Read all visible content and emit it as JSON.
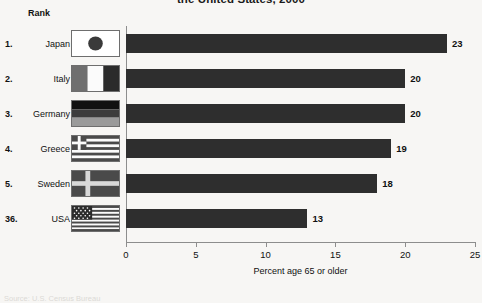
{
  "title": "the United States, 2000",
  "rank_header": "Rank",
  "source_note": "Source: U.S. Census Bureau",
  "chart_data": {
    "type": "bar",
    "orientation": "horizontal",
    "title": "the United States, 2000",
    "xlabel": "Percent age 65 or older",
    "ylabel": "",
    "xlim": [
      0,
      25
    ],
    "xticks": [
      0,
      5,
      10,
      15,
      20,
      25
    ],
    "xtick_labels": [
      "0",
      "5",
      "10",
      "15",
      "20",
      "25"
    ],
    "grid": false,
    "legend": "none",
    "bar_color": "#2e2e2e",
    "background_color": "#f7f6f4",
    "categories": [
      "Japan",
      "Italy",
      "Germany",
      "Greece",
      "Sweden",
      "USA"
    ],
    "values": [
      23,
      20,
      20,
      19,
      18,
      13
    ],
    "data_labels": [
      "23",
      "20",
      "20",
      "19",
      "18",
      "13"
    ],
    "ranks": [
      "1.",
      "2.",
      "3.",
      "4.",
      "5.",
      "36."
    ]
  },
  "rows": [
    {
      "rank": "1.",
      "country": "Japan",
      "value": "23",
      "flag": "flag-japan-icon"
    },
    {
      "rank": "2.",
      "country": "Italy",
      "value": "20",
      "flag": "flag-italy-icon"
    },
    {
      "rank": "3.",
      "country": "Germany",
      "value": "20",
      "flag": "flag-germany-icon"
    },
    {
      "rank": "4.",
      "country": "Greece",
      "value": "19",
      "flag": "flag-greece-icon"
    },
    {
      "rank": "5.",
      "country": "Sweden",
      "value": "18",
      "flag": "flag-sweden-icon"
    },
    {
      "rank": "36.",
      "country": "USA",
      "value": "13",
      "flag": "flag-usa-icon"
    }
  ],
  "axis": {
    "xlabel": "Percent age 65 or older",
    "ticks": [
      "0",
      "5",
      "10",
      "15",
      "20",
      "25"
    ]
  }
}
